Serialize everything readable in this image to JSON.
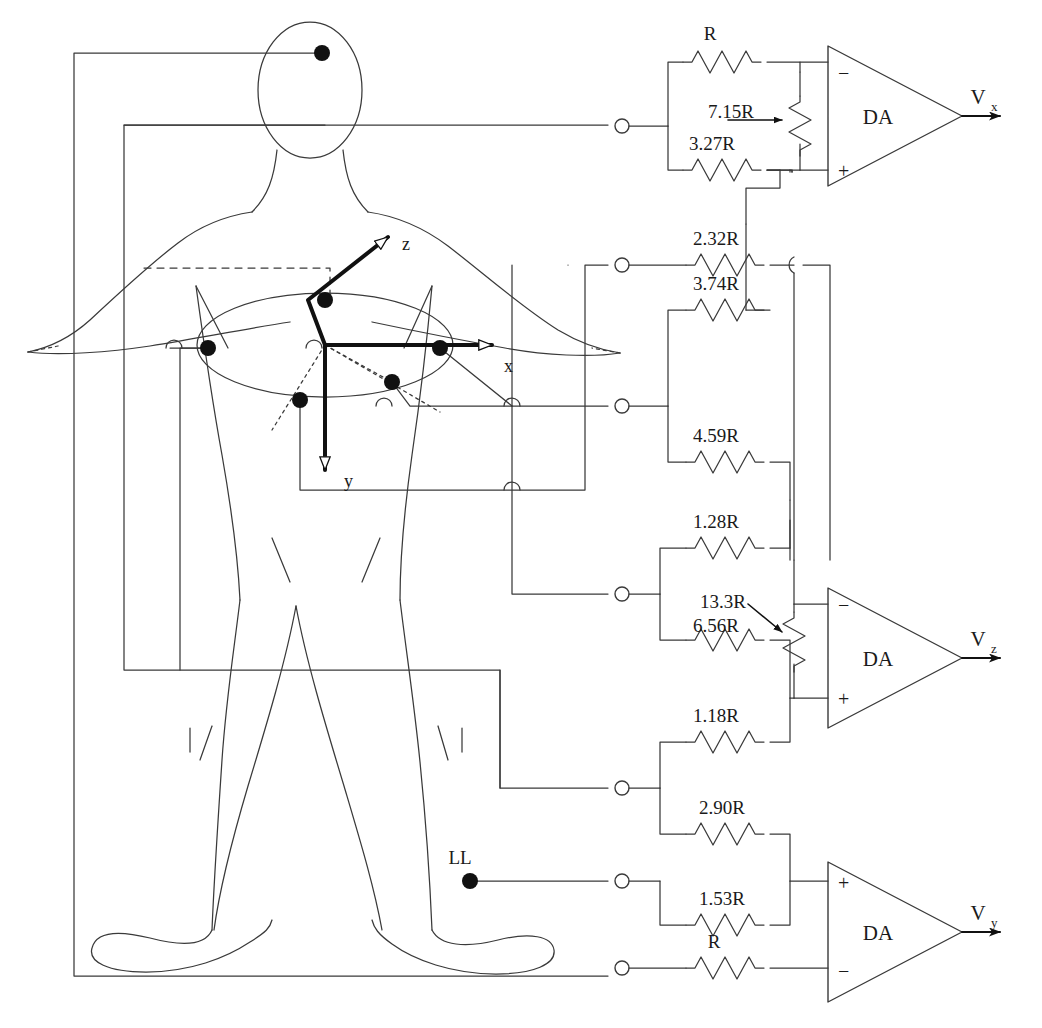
{
  "figure": {
    "stroke_color": "#3a3a3a",
    "accent_color": "#000000",
    "background": "#ffffff"
  },
  "body_diagram": {
    "electrode_label": "LL",
    "axes": [
      {
        "name": "x-axis",
        "label": "x"
      },
      {
        "name": "y-axis",
        "label": "y"
      },
      {
        "name": "z-axis",
        "label": "z"
      }
    ],
    "electrode_count": 7
  },
  "amplifiers": [
    {
      "name": "da-vx",
      "label": "DA",
      "output": "V",
      "output_sub": "x",
      "minus_label": "−",
      "plus_label": "+"
    },
    {
      "name": "da-vz",
      "label": "DA",
      "output": "V",
      "output_sub": "z",
      "minus_label": "−",
      "plus_label": "+"
    },
    {
      "name": "da-vy",
      "label": "DA",
      "output": "V",
      "output_sub": "y",
      "minus_label": "−",
      "plus_label": "+"
    }
  ],
  "resistors": [
    {
      "id": "r-top",
      "label": "R",
      "group": "vx"
    },
    {
      "id": "r-715",
      "label": "7.15R",
      "group": "vx",
      "orientation": "vertical",
      "has_pointer": true
    },
    {
      "id": "r-327",
      "label": "3.27R",
      "group": "vx"
    },
    {
      "id": "r-232",
      "label": "2.32R",
      "group": "vx"
    },
    {
      "id": "r-374",
      "label": "3.74R",
      "group": "vx"
    },
    {
      "id": "r-459",
      "label": "4.59R",
      "group": "vx"
    },
    {
      "id": "r-128",
      "label": "1.28R",
      "group": "vz"
    },
    {
      "id": "r-133",
      "label": "13.3R",
      "group": "vz",
      "orientation": "vertical",
      "has_pointer": true
    },
    {
      "id": "r-656",
      "label": "6.56R",
      "group": "vz"
    },
    {
      "id": "r-118",
      "label": "1.18R",
      "group": "vz"
    },
    {
      "id": "r-290",
      "label": "2.90R",
      "group": "vy"
    },
    {
      "id": "r-153",
      "label": "1.53R",
      "group": "vy"
    },
    {
      "id": "r-bottom",
      "label": "R",
      "group": "vy"
    }
  ]
}
